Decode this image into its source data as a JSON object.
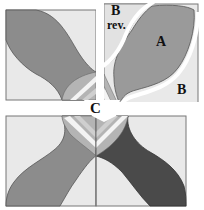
{
  "diagram": {
    "type": "quilt-block-pattern",
    "labels": {
      "a": "A",
      "b": "B",
      "b_rev_line1": "B",
      "b_rev_line2": "rev.",
      "c": "C"
    },
    "colors": {
      "background": "#e9e9e9",
      "border": "#777777",
      "petal_medium": "#8c8c8c",
      "petal_dark": "#4a4a4a",
      "petal_light": "#a9a9a9",
      "center_light": "#cfcfcf",
      "center_mid": "#b4b4b4",
      "gap": "#ffffff"
    }
  }
}
